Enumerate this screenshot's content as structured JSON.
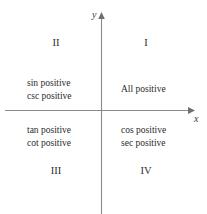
{
  "figure": {
    "type": "cartesian-quadrant-diagram",
    "axes": {
      "y_label": "y",
      "x_label": "x",
      "origin": {
        "x": 102,
        "y": 110
      },
      "x_axis_start_x": 5,
      "x_axis_end_x": 193,
      "y_axis_top_y": 14,
      "y_axis_bottom_y": 214,
      "line_color": "#8a8a8a",
      "arrowheads": [
        "y-up",
        "x-right"
      ]
    },
    "quadrants": [
      {
        "id": "I",
        "numeral": "I",
        "position": "top-right",
        "lines": [
          "All positive"
        ]
      },
      {
        "id": "II",
        "numeral": "II",
        "position": "top-left",
        "lines": [
          "sin positive",
          "csc positive"
        ]
      },
      {
        "id": "III",
        "numeral": "III",
        "position": "bottom-left",
        "lines": [
          "tan positive",
          "cot positive"
        ]
      },
      {
        "id": "IV",
        "numeral": "IV",
        "position": "bottom-right",
        "lines": [
          "cos positive",
          "sec positive"
        ]
      }
    ],
    "text_color": "#2b2b2b",
    "background_color": "#ffffff"
  }
}
